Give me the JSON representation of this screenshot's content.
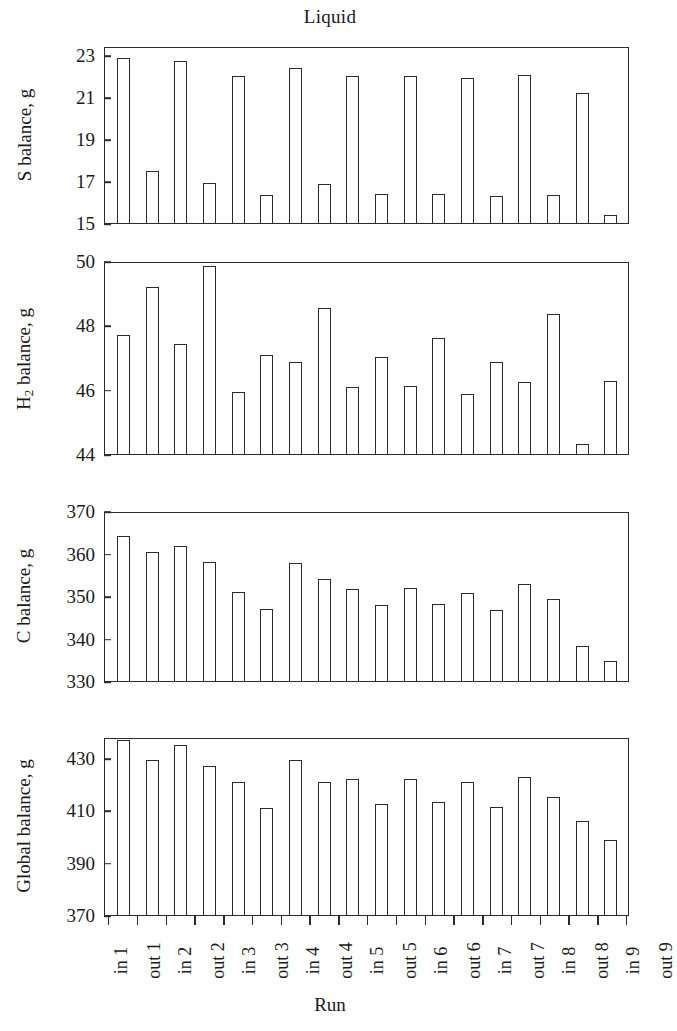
{
  "figure": {
    "title": "Liquid",
    "xlabel": "Run",
    "categories": [
      "in 1",
      "out 1",
      "in 2",
      "out 2",
      "in 3",
      "out 3",
      "in 4",
      "out 4",
      "in 5",
      "out 5",
      "in 6",
      "out 6",
      "in 7",
      "out 7",
      "in 8",
      "out 8",
      "in 9",
      "out 9"
    ]
  },
  "chart_data": [
    {
      "type": "bar",
      "title": "Liquid",
      "ylabel": "S balance, g",
      "xlabel": "Run",
      "categories": [
        "in 1",
        "out 1",
        "in 2",
        "out 2",
        "in 3",
        "out 3",
        "in 4",
        "out 4",
        "in 5",
        "out 5",
        "in 6",
        "out 6",
        "in 7",
        "out 7",
        "in 8",
        "out 8",
        "in 9",
        "out 9"
      ],
      "values": [
        22.95,
        17.5,
        22.8,
        16.95,
        22.1,
        16.35,
        22.5,
        16.9,
        22.1,
        16.4,
        22.1,
        16.4,
        22.0,
        16.3,
        22.15,
        16.35,
        21.3,
        15.4
      ],
      "yticks": [
        15,
        17,
        19,
        21,
        23
      ],
      "ylim": [
        15,
        23.45
      ],
      "grid": false,
      "legend": false
    },
    {
      "type": "bar",
      "ylabel": "H2 balance, g",
      "ylabel_html": "H<sub>2</sub> balance, g",
      "xlabel": "Run",
      "categories": [
        "in 1",
        "out 1",
        "in 2",
        "out 2",
        "in 3",
        "out 3",
        "in 4",
        "out 4",
        "in 5",
        "out 5",
        "in 6",
        "out 6",
        "in 7",
        "out 7",
        "in 8",
        "out 8",
        "in 9",
        "out 9"
      ],
      "values": [
        47.75,
        49.25,
        47.45,
        49.9,
        45.95,
        47.1,
        46.9,
        48.6,
        46.1,
        47.05,
        46.15,
        47.65,
        45.9,
        46.9,
        46.25,
        48.4,
        44.3,
        46.3
      ],
      "yticks": [
        44,
        46,
        48,
        50
      ],
      "ylim": [
        44,
        50
      ],
      "grid": false,
      "legend": false
    },
    {
      "type": "bar",
      "ylabel": "C balance, g",
      "xlabel": "Run",
      "categories": [
        "in 1",
        "out 1",
        "in 2",
        "out 2",
        "in 3",
        "out 3",
        "in 4",
        "out 4",
        "in 5",
        "out 5",
        "in 6",
        "out 6",
        "in 7",
        "out 7",
        "in 8",
        "out 8",
        "in 9",
        "out 9"
      ],
      "values": [
        364.5,
        360.8,
        362.2,
        358.3,
        351.2,
        347.2,
        358.2,
        354.2,
        352.0,
        348.2,
        352.2,
        348.4,
        351.0,
        347.0,
        353.0,
        349.5,
        338.3,
        334.8
      ],
      "yticks": [
        330,
        340,
        350,
        360,
        370
      ],
      "ylim": [
        330,
        370
      ],
      "grid": false,
      "legend": false
    },
    {
      "type": "bar",
      "ylabel": "Global balance, g",
      "xlabel": "Run",
      "categories": [
        "in 1",
        "out 1",
        "in 2",
        "out 2",
        "in 3",
        "out 3",
        "in 4",
        "out 4",
        "in 5",
        "out 5",
        "in 6",
        "out 6",
        "in 7",
        "out 7",
        "in 8",
        "out 8",
        "in 9",
        "out 9"
      ],
      "values": [
        437.5,
        429.8,
        435.5,
        427.5,
        421.5,
        411.5,
        430.0,
        421.5,
        422.5,
        412.7,
        422.6,
        413.8,
        421.3,
        411.6,
        423.5,
        415.5,
        406.3,
        398.8
      ],
      "yticks": [
        370,
        390,
        410,
        430
      ],
      "ylim": [
        370,
        438
      ],
      "grid": false,
      "legend": false
    }
  ]
}
